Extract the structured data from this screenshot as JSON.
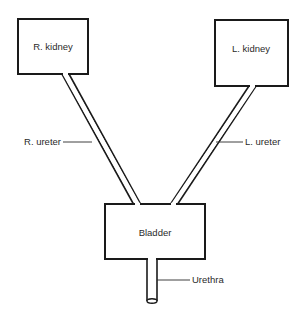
{
  "diagram": {
    "title": "",
    "nodes": {
      "r_kidney": {
        "label": "R. kidney"
      },
      "l_kidney": {
        "label": "L. kidney"
      },
      "bladder": {
        "label": "Bladder"
      }
    },
    "labels": {
      "r_ureter": "R. ureter",
      "l_ureter": "L. ureter",
      "urethra": "Urethra"
    },
    "edges": [
      {
        "from": "R. kidney",
        "to": "Bladder",
        "via": "R. ureter"
      },
      {
        "from": "L. kidney",
        "to": "Bladder",
        "via": "L. ureter"
      },
      {
        "from": "Bladder",
        "to": "exterior",
        "via": "Urethra"
      }
    ],
    "colors": {
      "stroke": "#1a1a1a",
      "text": "#2a2a2a",
      "background": "#ffffff"
    }
  }
}
